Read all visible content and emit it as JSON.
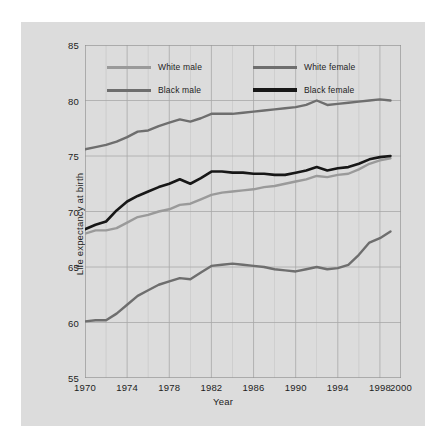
{
  "figure": {
    "background_color": "#dcdcdc",
    "plot_background_color": "#dcdcdc",
    "grid_color": "#a8a8a8",
    "axis_color": "#8f8f8f",
    "text_color": "#1d1d1d"
  },
  "axes": {
    "ylabel": "Life expectancy at birth",
    "xlabel": "Year",
    "ytick_labels": [
      "85",
      "80",
      "75",
      "70",
      "65",
      "60",
      "55"
    ],
    "xtick_labels": [
      "1970",
      "1974",
      "1978",
      "1982",
      "1986",
      "1990",
      "1994",
      "1998",
      "2000"
    ]
  },
  "legend": {
    "entries": [
      {
        "label": "White male",
        "color": "#9a9a9a"
      },
      {
        "label": "White female",
        "color": "#6e6e6e"
      },
      {
        "label": "Black male",
        "color": "#6e6e6e"
      },
      {
        "label": "Black female",
        "color": "#171717"
      }
    ]
  },
  "chart_data": {
    "type": "line",
    "title": "",
    "xlabel": "Year",
    "ylabel": "Life expectancy at birth",
    "xlim": [
      1970,
      2000
    ],
    "ylim": [
      55,
      85
    ],
    "yticks": [
      55,
      60,
      65,
      70,
      75,
      80,
      85
    ],
    "xticks": [
      1970,
      1974,
      1978,
      1982,
      1986,
      1990,
      1994,
      1998,
      2000
    ],
    "grid": true,
    "legend_position": "upper-left-inside",
    "x": [
      1970,
      1971,
      1972,
      1973,
      1974,
      1975,
      1976,
      1977,
      1978,
      1979,
      1980,
      1981,
      1982,
      1983,
      1984,
      1985,
      1986,
      1987,
      1988,
      1989,
      1990,
      1991,
      1992,
      1993,
      1994,
      1995,
      1996,
      1997,
      1998,
      1999
    ],
    "series": [
      {
        "name": "White male",
        "color": "#9a9a9a",
        "values": [
          68.0,
          68.3,
          68.3,
          68.5,
          69.0,
          69.5,
          69.7,
          70.0,
          70.2,
          70.6,
          70.7,
          71.1,
          71.5,
          71.7,
          71.8,
          71.9,
          72.0,
          72.2,
          72.3,
          72.5,
          72.7,
          72.9,
          73.2,
          73.1,
          73.3,
          73.4,
          73.8,
          74.3,
          74.6,
          74.8
        ]
      },
      {
        "name": "White female",
        "color": "#6e6e6e",
        "values": [
          75.6,
          75.8,
          76.0,
          76.3,
          76.7,
          77.2,
          77.3,
          77.7,
          78.0,
          78.3,
          78.1,
          78.4,
          78.8,
          78.8,
          78.8,
          78.9,
          79.0,
          79.1,
          79.2,
          79.3,
          79.4,
          79.6,
          80.0,
          79.6,
          79.7,
          79.8,
          79.9,
          80.0,
          80.1,
          80.0
        ]
      },
      {
        "name": "Black male",
        "color": "#6e6e6e",
        "values": [
          60.1,
          60.2,
          60.2,
          60.8,
          61.6,
          62.4,
          62.9,
          63.4,
          63.7,
          64.0,
          63.9,
          64.5,
          65.1,
          65.2,
          65.3,
          65.2,
          65.1,
          65.0,
          64.8,
          64.7,
          64.6,
          64.8,
          65.0,
          64.8,
          64.9,
          65.2,
          66.1,
          67.2,
          67.6,
          68.2
        ]
      },
      {
        "name": "Black female",
        "color": "#171717",
        "values": [
          68.4,
          68.8,
          69.1,
          70.1,
          70.9,
          71.4,
          71.8,
          72.2,
          72.5,
          72.9,
          72.5,
          73.0,
          73.6,
          73.6,
          73.5,
          73.5,
          73.4,
          73.4,
          73.3,
          73.3,
          73.5,
          73.7,
          74.0,
          73.7,
          73.9,
          74.0,
          74.3,
          74.7,
          74.9,
          75.0
        ]
      }
    ]
  }
}
